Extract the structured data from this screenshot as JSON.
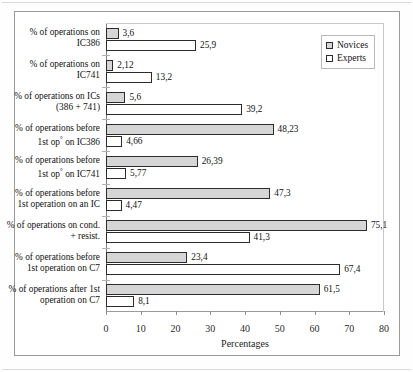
{
  "chart_data": {
    "type": "bar",
    "orientation": "horizontal",
    "title": "",
    "xlabel": "Percentages",
    "ylabel": "",
    "xlim": [
      0,
      80
    ],
    "xticks": [
      0,
      10,
      20,
      30,
      40,
      50,
      60,
      70,
      80
    ],
    "grid": false,
    "legend_position": "top-right",
    "categories": [
      "% of operations on IC386",
      "% of operations on IC741",
      "% of operations on ICs (386 + 741)",
      "% of operations before 1st op° on IC386",
      "% of operations before 1st op° on IC741",
      "% of operations before 1st operation on an IC",
      "% of operations on cond. + resist.",
      "% of operations before 1st operation on C7",
      "% of operations after 1st operation on C7"
    ],
    "category_lines": [
      [
        "% of operations on",
        "IC386"
      ],
      [
        "% of operations on",
        "IC741"
      ],
      [
        "% of operations on ICs",
        "(386 + 741)"
      ],
      [
        "% of operations before",
        "1st op° on IC386"
      ],
      [
        "% of operations before",
        "1st op° on IC741"
      ],
      [
        "% of operations before",
        "1st operation on an IC"
      ],
      [
        "% of operations on cond.",
        "+ resist."
      ],
      [
        "% of operations before",
        "1st operation on C7"
      ],
      [
        "% of operations after 1st",
        "operation on C7"
      ]
    ],
    "series": [
      {
        "name": "Novices",
        "color": "#d6d6d6",
        "values": [
          3.6,
          2.12,
          5.6,
          48.23,
          26.39,
          47.3,
          75.1,
          23.4,
          61.5
        ],
        "labels": [
          "3,6",
          "2,12",
          "5,6",
          "48,23",
          "26,39",
          "47,3",
          "75,1",
          "23,4",
          "61,5"
        ]
      },
      {
        "name": "Experts",
        "color": "#ffffff",
        "values": [
          25.9,
          13.2,
          39.2,
          4.66,
          5.77,
          4.47,
          41.3,
          67.4,
          8.1
        ],
        "labels": [
          "25,9",
          "13,2",
          "39,2",
          "4,66",
          "5,77",
          "4,47",
          "41,3",
          "67,4",
          "8,1"
        ]
      }
    ]
  },
  "legend": {
    "items": [
      {
        "label": "Novices",
        "swatch": "novices"
      },
      {
        "label": "Experts",
        "swatch": "experts"
      }
    ]
  },
  "axis": {
    "x_title": "Percentages",
    "tick_labels": [
      "0",
      "10",
      "20",
      "30",
      "40",
      "50",
      "60",
      "70",
      "80"
    ]
  }
}
